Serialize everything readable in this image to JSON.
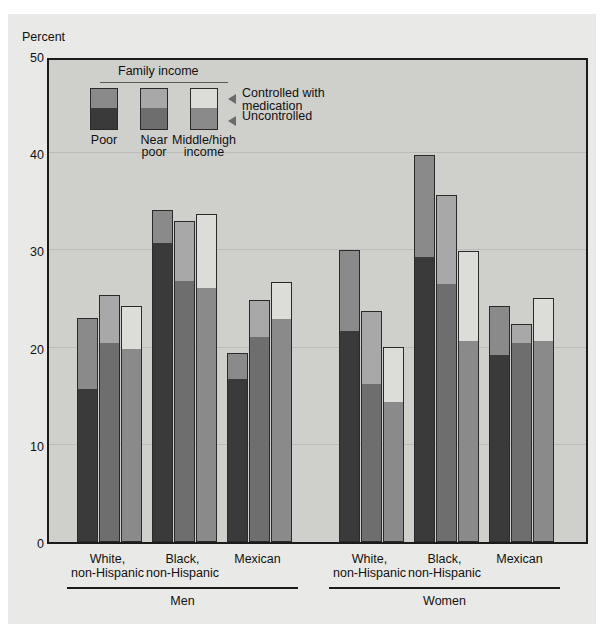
{
  "axis": {
    "ylabel": "Percent",
    "yticks": [
      0,
      10,
      20,
      30,
      40,
      50
    ],
    "ymin": 0,
    "ymax": 50
  },
  "legend": {
    "title": "Family income",
    "items": [
      {
        "key": "poor",
        "label_line1": "Poor",
        "label_line2": "",
        "color_lower": "#3a3a3a",
        "color_upper": "#8a8a8a"
      },
      {
        "key": "near_poor",
        "label_line1": "Near",
        "label_line2": "poor",
        "color_lower": "#6e6e6e",
        "color_upper": "#a8a8a8"
      },
      {
        "key": "middle_high",
        "label_line1": "Middle/high",
        "label_line2": "income",
        "color_lower": "#8a8a8a",
        "color_upper": "#dcdcd8"
      }
    ],
    "series_labels": {
      "upper_line1": "Controlled with",
      "upper_line2": "medication",
      "lower": "Uncontrolled"
    }
  },
  "chart_data": {
    "type": "bar",
    "subtype": "stacked-grouped",
    "title": "",
    "xlabel": "",
    "ylabel": "Percent",
    "ylim": [
      0,
      50
    ],
    "grid": true,
    "legend_position": "inside-top-left",
    "stack_order": [
      "Uncontrolled",
      "Controlled with medication"
    ],
    "series": [
      {
        "name": "Uncontrolled"
      },
      {
        "name": "Controlled with medication"
      }
    ],
    "income_levels": [
      "Poor",
      "Near poor",
      "Middle/high income"
    ],
    "sex_groups": [
      "Men",
      "Women"
    ],
    "race_groups": [
      "White, non-Hispanic",
      "Black, non-Hispanic",
      "Mexican"
    ],
    "data": [
      {
        "sex": "Men",
        "race": "White, non-Hispanic",
        "bars": [
          {
            "income": "Poor",
            "uncontrolled": 15.6,
            "controlled": 7.4,
            "total": 23.0
          },
          {
            "income": "Near poor",
            "uncontrolled": 20.4,
            "controlled": 5.0,
            "total": 25.4
          },
          {
            "income": "Middle/high income",
            "uncontrolled": 19.8,
            "controlled": 4.5,
            "total": 24.3
          }
        ]
      },
      {
        "sex": "Men",
        "race": "Black, non-Hispanic",
        "bars": [
          {
            "income": "Poor",
            "uncontrolled": 30.7,
            "controlled": 3.5,
            "total": 34.2
          },
          {
            "income": "Near poor",
            "uncontrolled": 26.7,
            "controlled": 6.3,
            "total": 33.0
          },
          {
            "income": "Middle/high income",
            "uncontrolled": 26.0,
            "controlled": 7.7,
            "total": 33.7
          }
        ]
      },
      {
        "sex": "Men",
        "race": "Mexican",
        "bars": [
          {
            "income": "Poor",
            "uncontrolled": 16.7,
            "controlled": 2.7,
            "total": 19.4
          },
          {
            "income": "Near poor",
            "uncontrolled": 21.0,
            "controlled": 3.9,
            "total": 24.9
          },
          {
            "income": "Middle/high income",
            "uncontrolled": 22.8,
            "controlled": 3.9,
            "total": 26.7
          }
        ]
      },
      {
        "sex": "Women",
        "race": "White, non-Hispanic",
        "bars": [
          {
            "income": "Poor",
            "uncontrolled": 21.6,
            "controlled": 8.4,
            "total": 30.0
          },
          {
            "income": "Near poor",
            "uncontrolled": 16.2,
            "controlled": 7.6,
            "total": 23.8
          },
          {
            "income": "Middle/high income",
            "uncontrolled": 14.3,
            "controlled": 5.8,
            "total": 20.1
          }
        ]
      },
      {
        "sex": "Women",
        "race": "Black, non-Hispanic",
        "bars": [
          {
            "income": "Poor",
            "uncontrolled": 29.2,
            "controlled": 10.6,
            "total": 39.8
          },
          {
            "income": "Near poor",
            "uncontrolled": 26.4,
            "controlled": 9.3,
            "total": 35.7
          },
          {
            "income": "Middle/high income",
            "uncontrolled": 20.6,
            "controlled": 9.3,
            "total": 29.9
          }
        ]
      },
      {
        "sex": "Women",
        "race": "Mexican",
        "bars": [
          {
            "income": "Poor",
            "uncontrolled": 19.1,
            "controlled": 5.2,
            "total": 24.3
          },
          {
            "income": "Near poor",
            "uncontrolled": 20.4,
            "controlled": 2.0,
            "total": 22.4
          },
          {
            "income": "Middle/high income",
            "uncontrolled": 20.6,
            "controlled": 4.5,
            "total": 25.1
          }
        ]
      }
    ]
  },
  "xaxis": {
    "race_labels": [
      {
        "line1": "White,",
        "line2": "non-Hispanic"
      },
      {
        "line1": "Black,",
        "line2": "non-Hispanic"
      },
      {
        "line1": "Mexican",
        "line2": ""
      }
    ],
    "group_labels": [
      "Men",
      "Women"
    ]
  }
}
